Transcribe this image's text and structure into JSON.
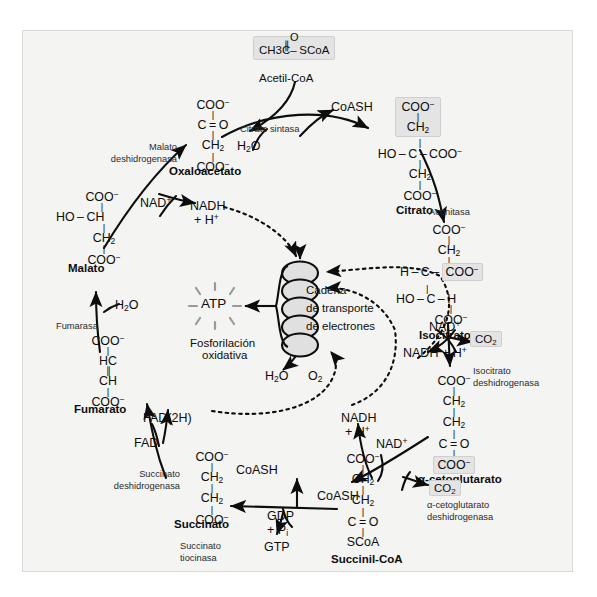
{
  "diagram": {
    "language": "es",
    "background_color": "#f4f4f2",
    "frame_border_color": "#d9d9d7",
    "highlight_fill": "#e4e4e4",
    "highlight_border": "#cfcfcf",
    "line_color": "#0d0d0d"
  },
  "metabolites": {
    "acetil_coa": {
      "name": "Acetil-CoA",
      "formula_main": "CH3C",
      "formula_tail": "SCoA",
      "formula_top": "O",
      "highlighted": true
    },
    "oxaloacetato": {
      "name": "Oxaloacetato",
      "lines": [
        "COO",
        "C = O",
        "CH2",
        "COO"
      ]
    },
    "citrato": {
      "name": "Citrato",
      "lines": [
        "COO",
        "CH2",
        "HO - C - COO",
        "CH2",
        "COO"
      ],
      "highlighted_lines": [
        "COO",
        "CH2"
      ]
    },
    "isocitrato": {
      "name": "Isocitrato",
      "lines": [
        "COO",
        "CH2",
        "H - C - COO",
        "HO - C - H",
        "COO"
      ],
      "highlighted_fragment": "COO"
    },
    "alfa_cetoglutarato": {
      "name": "α-cetoglutarato",
      "lines": [
        "COO",
        "CH2",
        "CH2",
        "C = O",
        "COO"
      ],
      "highlighted_fragment": "COO"
    },
    "succinil_coa": {
      "name": "Succinil-CoA",
      "lines": [
        "COO",
        "CH2",
        "CH2",
        "C = O",
        "SCoA"
      ]
    },
    "succinato": {
      "name": "Succinato",
      "lines": [
        "COO",
        "CH2",
        "CH2",
        "COO"
      ]
    },
    "fumarato": {
      "name": "Fumarato",
      "lines": [
        "COO",
        "HC",
        "CH",
        "COO"
      ]
    },
    "malato": {
      "name": "Malato",
      "lines": [
        "COO",
        "HO - CH",
        "CH2",
        "COO"
      ]
    }
  },
  "enzymes": {
    "citrato_sintasa": "Citrato sintasa",
    "aconitasa": "Aconitasa",
    "isocitrato_deshidrogenasa_l1": "Isocitrato",
    "isocitrato_deshidrogenasa_l2": "deshidrogenasa",
    "cetoglutarato_deshidrogenasa_l1": "α-cetoglutarato",
    "cetoglutarato_deshidrogenasa_l2": "deshidrogenasa",
    "succinato_tiocinasa_l1": "Succinato",
    "succinato_tiocinasa_l2": "tiocinasa",
    "succinato_deshidrogenasa_l1": "Succinato",
    "succinato_deshidrogenasa_l2": "deshidrogenasa",
    "fumarasa": "Fumarasa",
    "malato_deshidrogenasa_l1": "Malato",
    "malato_deshidrogenasa_l2": "deshidrogenasa"
  },
  "cofactors": {
    "coash_top": "CoASH",
    "coash_succinato": "CoASH",
    "coash_cetoglutarato": "CoASH",
    "h2o_citrato": "H2O",
    "h2o_fumarasa": "H2O",
    "nad_malato": "NAD+",
    "nadh_malato_l1": "NADH",
    "nadh_malato_l2": "+ H+",
    "nad_isocitrato": "NAD+",
    "nadh_isocitrato": "NADH + H+",
    "co2_isocitrato": "CO2",
    "nad_cetoglutarato": "NAD+",
    "nadh_cetoglutarato_l1": "NADH",
    "nadh_cetoglutarato_l2": "+ H+",
    "co2_cetoglutarato": "CO2",
    "gdp_l1": "GDP",
    "gdp_l2": "+ Pi",
    "gtp": "GTP",
    "fad": "FAD",
    "fad2h": "FAD(2H)"
  },
  "electron_transport": {
    "chain_l1": "Cadena",
    "chain_l2": "de transporte",
    "chain_l3": "de electrones",
    "atp": "ATP",
    "oxphos_l1": "Fosforilación",
    "oxphos_l2": "oxidativa",
    "h2o": "H2O",
    "o2": "O2",
    "oval_count": 5
  }
}
